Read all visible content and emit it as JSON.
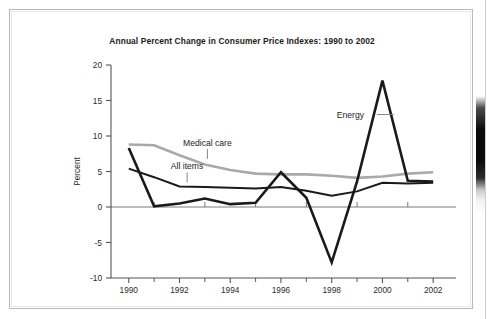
{
  "figure": {
    "title": "Annual Percent Change in Consumer Price Indexes: 1990 to 2002",
    "ylabel": "Percent"
  },
  "labels": {
    "energy": "Energy",
    "medical_care": "Medical care",
    "all_items": "All items"
  },
  "colors": {
    "series_black": "#1a1a1a",
    "series_gray": "#a9a9a9",
    "axis": "#6b6b6b",
    "text": "#1c1c1c",
    "frame": "#b9b9b9"
  },
  "chart_data": {
    "type": "line",
    "title": "Annual Percent Change in Consumer Price Indexes: 1990 to 2002",
    "xlabel": "",
    "ylabel": "Percent",
    "x": [
      1990,
      1991,
      1992,
      1993,
      1994,
      1995,
      1996,
      1997,
      1998,
      1999,
      2000,
      2001,
      2002
    ],
    "xtick_labels": [
      "1990",
      "1992",
      "1994",
      "1996",
      "1998",
      "2000",
      "2002"
    ],
    "xtick_values": [
      1990,
      1992,
      1994,
      1996,
      1998,
      2000,
      2002
    ],
    "minor_xticks": [
      1991,
      1993,
      1995,
      1997,
      1999,
      2001
    ],
    "ytick_labels": [
      "20",
      "15",
      "10",
      "5",
      "0",
      "-5",
      "-10"
    ],
    "ytick_values": [
      20,
      15,
      10,
      5,
      0,
      -5,
      -10
    ],
    "ylim": [
      -10,
      20
    ],
    "xlim": [
      1989.3,
      2002.9
    ],
    "grid": false,
    "legend_position": "inline-annotations",
    "zero_line": true,
    "series": [
      {
        "name": "Energy",
        "color": "#1a1a1a",
        "width": 2.6,
        "values": [
          8.3,
          0.1,
          0.5,
          1.2,
          0.4,
          0.6,
          4.9,
          1.3,
          -7.8,
          3.6,
          17.8,
          3.7,
          3.6
        ]
      },
      {
        "name": "Medical care",
        "color": "#a9a9a9",
        "width": 2.6,
        "values": [
          8.8,
          8.7,
          7.3,
          6.0,
          5.2,
          4.7,
          4.6,
          4.6,
          4.4,
          4.1,
          4.3,
          4.7,
          4.9
        ]
      },
      {
        "name": "All items",
        "color": "#1a1a1a",
        "width": 2.0,
        "values": [
          5.4,
          4.2,
          2.9,
          2.8,
          2.7,
          2.6,
          2.8,
          2.3,
          1.6,
          2.2,
          3.4,
          3.3,
          3.4
        ]
      }
    ],
    "annotations": [
      {
        "text": "Energy",
        "x": 1998.2,
        "y": 12.6,
        "leader": "right"
      },
      {
        "text": "Medical care",
        "x": 1993.1,
        "y": 8.6,
        "leader": "down"
      },
      {
        "text": "All items",
        "x": 1992.3,
        "y": 5.3,
        "leader": "down"
      }
    ]
  }
}
